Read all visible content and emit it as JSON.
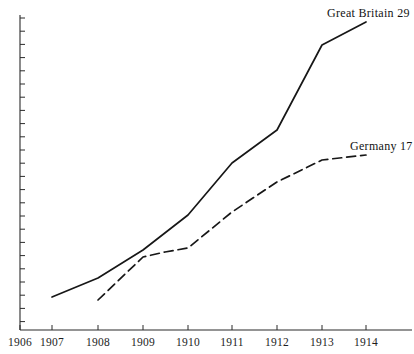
{
  "chart_data": {
    "type": "line",
    "title": "",
    "xlabel": "",
    "ylabel": "",
    "grid": false,
    "legend_position": "inline-end-of-line",
    "x": [
      1906,
      1907,
      1908,
      1909,
      1910,
      1911,
      1912,
      1913,
      1914
    ],
    "xtick_labels": [
      "1906",
      "1907",
      "1908",
      "1909",
      "1910",
      "1911",
      "1912",
      "1913",
      "1914"
    ],
    "xlim": [
      1906,
      1914
    ],
    "ylim": [
      0,
      32
    ],
    "ytick_labels": [],
    "ytick_count": 24,
    "series": [
      {
        "name": "Great Britain",
        "end_value_label": "29",
        "style": "solid",
        "color": "#171717",
        "x": [
          1907,
          1908,
          1909,
          1910,
          1911,
          1912,
          1913,
          1914
        ],
        "values": [
          6.5,
          9.0,
          12.5,
          17.0,
          24.0,
          28.0,
          35.5,
          38.5
        ]
      },
      {
        "name": "Germany",
        "end_value_label": "17",
        "style": "dashed",
        "color": "#171717",
        "x": [
          1908,
          1909,
          1909.5,
          1910,
          1911,
          1912,
          1913,
          1914
        ],
        "values": [
          6.0,
          11.5,
          12.2,
          12.7,
          17.5,
          21.5,
          24.5,
          25.2
        ]
      }
    ],
    "annotations": [
      {
        "text": "Great Britain 29",
        "x_px": 327,
        "y_px": 6
      },
      {
        "text": "Germany 17",
        "x_px": 350,
        "y_px": 139
      }
    ]
  },
  "geometry": {
    "axis_origin_x": 20,
    "axis_bottom_y": 330,
    "axis_top_y": 15,
    "x_tick_px": [
      20,
      52,
      98,
      143,
      188,
      232,
      277,
      322,
      366
    ],
    "x_tick_label_y": 336,
    "great_britain_path": "M52,297 L98,278 L143,250 L188,215 L232,163 L277,130 L322,45 L366,22",
    "germany_path": "M98,300 L143,257 L165,252 L188,248 L232,212 L277,182 L322,160 L366,155",
    "y_tick_start_y": 18,
    "y_tick_spacing": 13.2,
    "y_tick_length": 5
  }
}
